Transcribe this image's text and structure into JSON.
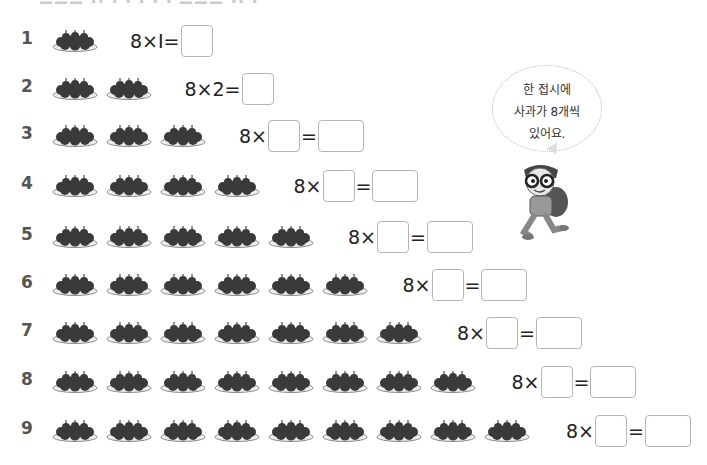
{
  "header": {
    "cutoff_text": "▬▬▬ ▪▪ ▪ ▪ ▪ ▪ ▪ ▬▬▬ ▪▪ ▪"
  },
  "rows": [
    {
      "n": "1",
      "plates": 1,
      "eq_prefix": "8×Ⅰ=",
      "multiplier": "1",
      "has_multiplier_box": false
    },
    {
      "n": "2",
      "plates": 2,
      "eq_prefix": "8×2=",
      "multiplier": "2",
      "has_multiplier_box": false
    },
    {
      "n": "3",
      "plates": 3,
      "eq_prefix": "8×",
      "multiplier": "",
      "has_multiplier_box": true
    },
    {
      "n": "4",
      "plates": 4,
      "eq_prefix": "8×",
      "multiplier": "",
      "has_multiplier_box": true
    },
    {
      "n": "5",
      "plates": 5,
      "eq_prefix": "8×",
      "multiplier": "",
      "has_multiplier_box": true
    },
    {
      "n": "6",
      "plates": 6,
      "eq_prefix": "8×",
      "multiplier": "",
      "has_multiplier_box": true
    },
    {
      "n": "7",
      "plates": 7,
      "eq_prefix": "8×",
      "multiplier": "",
      "has_multiplier_box": true
    },
    {
      "n": "8",
      "plates": 8,
      "eq_prefix": "8×",
      "multiplier": "",
      "has_multiplier_box": true
    },
    {
      "n": "9",
      "plates": 9,
      "eq_prefix": "8×",
      "multiplier": "",
      "has_multiplier_box": true
    }
  ],
  "equals": "=",
  "speech_bubble": {
    "line1": "한 접시에",
    "line2": "사과가 8개씩",
    "line3": "있어요."
  },
  "icons": {
    "plate": "apple-plate-icon",
    "character": "boy-character-icon"
  },
  "colors": {
    "box_border": "#b5b5b5",
    "number": "#555555",
    "apple": "#3a3a3a"
  }
}
